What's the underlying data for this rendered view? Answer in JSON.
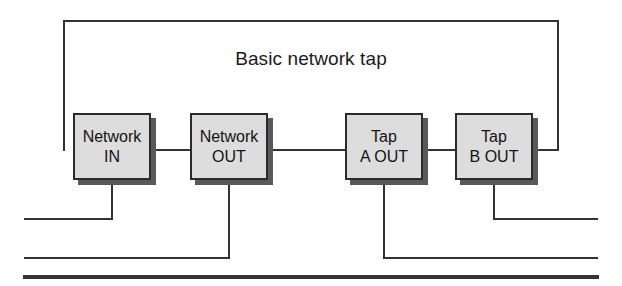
{
  "diagram": {
    "title": "Basic network tap",
    "type": "network-tap-wiring-diagram",
    "canvas": {
      "width": 622,
      "height": 286,
      "background": "#ffffff"
    },
    "style": {
      "box_fill": "#dddddd",
      "box_border": "#2b2b2b",
      "box_shadow": "#595959",
      "wire_color": "#333333",
      "text_color": "#141414"
    },
    "nodes": [
      {
        "id": "network-in",
        "label_line1": "Network",
        "label_line2": "IN",
        "x": 73,
        "y": 113,
        "width": 78,
        "height": 67
      },
      {
        "id": "network-out",
        "label_line1": "Network",
        "label_line2": "OUT",
        "x": 190,
        "y": 113,
        "width": 78,
        "height": 67
      },
      {
        "id": "tap-a-out",
        "label_line1": "Tap",
        "label_line2": "A OUT",
        "x": 345,
        "y": 113,
        "width": 78,
        "height": 67
      },
      {
        "id": "tap-b-out",
        "label_line1": "Tap",
        "label_line2": "B OUT",
        "x": 455,
        "y": 113,
        "width": 78,
        "height": 67
      }
    ],
    "wires": [
      {
        "id": "loop-top",
        "description": "Top loop wire from Network IN left side, up and over to Tap B OUT right side",
        "points": "64,150 64,21 558,21 558,150 533,150"
      },
      {
        "id": "link-in-to-out",
        "description": "Horizontal link between Network IN and Network OUT",
        "points": "151,150 190,150"
      },
      {
        "id": "link-out-to-tap-a",
        "description": "Horizontal link between Network OUT and Tap A OUT",
        "points": "268,150 345,150"
      },
      {
        "id": "link-tap-a-to-tap-b",
        "description": "Horizontal link between Tap A OUT and Tap B OUT",
        "points": "423,150 455,150"
      },
      {
        "id": "drop-network-in",
        "description": "Drop from Network IN down to upper bus, then left",
        "points": "112,180 112,219 25,219"
      },
      {
        "id": "drop-network-out",
        "description": "Drop from Network OUT down to middle bus, then left",
        "points": "229,180 229,258 25,258"
      },
      {
        "id": "drop-tap-a-out",
        "description": "Drop from Tap A OUT down to middle bus, then right",
        "points": "384,180 384,258 597,258"
      },
      {
        "id": "drop-tap-b-out",
        "description": "Drop from Tap B OUT down to upper bus, then right",
        "points": "494,180 494,219 597,219"
      },
      {
        "id": "bottom-bus",
        "description": "Thick horizontal bus line at bottom",
        "points": "25,277 597,277"
      }
    ]
  }
}
